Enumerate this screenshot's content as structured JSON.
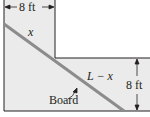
{
  "diagram": {
    "type": "hallway-corner-board",
    "labels": {
      "top_width": "8 ft",
      "right_height": "8 ft",
      "segment_upper": "x",
      "segment_lower": "L − x",
      "board": "Board"
    },
    "colors": {
      "corridor_fill": "#ebebeb",
      "wall_line": "#231f20",
      "board": "#8c8c8c",
      "background": "#ffffff"
    }
  }
}
